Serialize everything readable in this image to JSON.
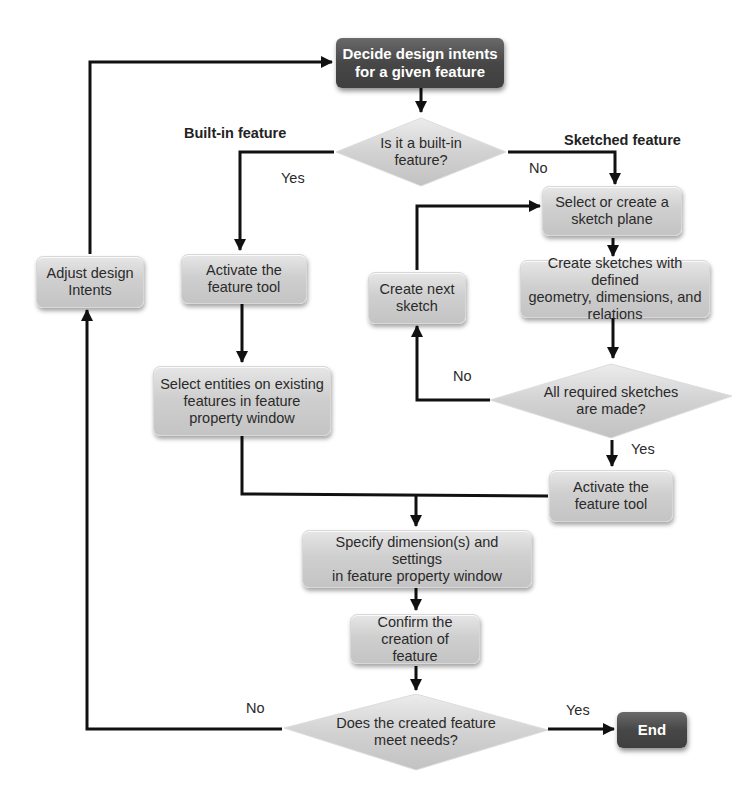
{
  "diagram": {
    "type": "flowchart",
    "nodes": {
      "start": "Decide design intents for a given feature",
      "q_builtin": "Is it a built-in feature?",
      "activate_builtin": "Activate the feature tool",
      "select_entities": "Select entities on existing features in feature property window",
      "select_plane": "Select or create a sketch plane",
      "create_sketches": "Create sketches with defined geometry, dimensions, and relations",
      "create_next": "Create next sketch",
      "q_sketches": "All required sketches are made?",
      "activate_sketched": "Activate the feature tool",
      "specify_dims": "Specify dimension(s) and settings in feature property window",
      "confirm": "Confirm the creation of feature",
      "q_meet": "Does the created feature meet needs?",
      "end": "End",
      "adjust": "Adjust design Intents"
    },
    "lines": {
      "start": [
        "Decide design intents",
        "for a given feature"
      ],
      "q_builtin": [
        "Is it a built-in",
        "feature?"
      ],
      "activate_builtin": [
        "Activate the",
        "feature tool"
      ],
      "select_entities": [
        "Select entities on existing",
        "features in feature",
        "property window"
      ],
      "select_plane": [
        "Select or create a",
        "sketch plane"
      ],
      "create_sketches": [
        "Create sketches with defined",
        "geometry, dimensions, and",
        "relations"
      ],
      "create_next": [
        "Create next",
        "sketch"
      ],
      "q_sketches": [
        "All required sketches",
        "are made?"
      ],
      "activate_sketched": [
        "Activate the",
        "feature tool"
      ],
      "specify_dims": [
        "Specify dimension(s) and settings",
        "in feature property window"
      ],
      "confirm": [
        "Confirm the",
        "creation of feature"
      ],
      "q_meet": [
        "Does the created feature",
        "meet needs?"
      ],
      "adjust": [
        "Adjust design",
        "Intents"
      ]
    },
    "section_labels": {
      "builtin": "Built-in feature",
      "sketched": "Sketched feature"
    },
    "edge_labels": {
      "builtin_yes": "Yes",
      "builtin_no": "No",
      "sketches_no": "No",
      "sketches_yes": "Yes",
      "meet_no": "No",
      "meet_yes": "Yes"
    },
    "colors": {
      "dark_node": "#474747",
      "light_node": "#d0d0d0",
      "line": "#111111",
      "text": "#2a2a2a"
    }
  }
}
